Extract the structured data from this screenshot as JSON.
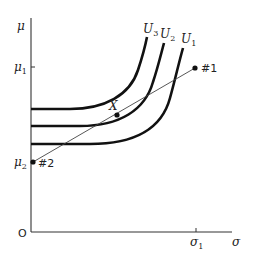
{
  "diagram": {
    "axes": {
      "y_label": "μ",
      "x_label": "σ",
      "origin_label": "O",
      "y_ticks": [
        {
          "label": "μ",
          "sub": "1"
        },
        {
          "label": "μ",
          "sub": "2"
        }
      ],
      "x_ticks": [
        {
          "label": "σ",
          "sub": "1"
        }
      ]
    },
    "curves": [
      {
        "name": "U",
        "sub": "3"
      },
      {
        "name": "U",
        "sub": "2"
      },
      {
        "name": "U",
        "sub": "1"
      }
    ],
    "points": {
      "p1": "#1",
      "p2": "#2",
      "x": "X"
    },
    "colors": {
      "ink": "#111111",
      "thin_line": "#444444",
      "background": "#ffffff"
    }
  }
}
